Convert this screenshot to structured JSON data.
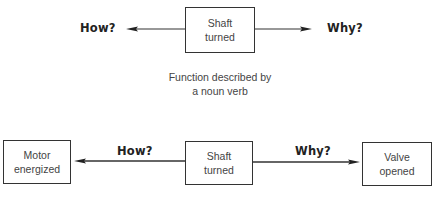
{
  "top": {
    "center_box": {
      "line1": "Shaft",
      "line2": "turned"
    },
    "how_label": "How?",
    "why_label": "Why?",
    "caption": {
      "line1": "Function described by",
      "line2": "a noun verb"
    }
  },
  "bottom": {
    "left_box": {
      "line1": "Motor",
      "line2": "energized"
    },
    "center_box": {
      "line1": "Shaft",
      "line2": "turned"
    },
    "right_box": {
      "line1": "Valve",
      "line2": "opened"
    },
    "how_label": "How?",
    "why_label": "Why?"
  },
  "colors": {
    "line": "#333333",
    "text": "#222222"
  }
}
